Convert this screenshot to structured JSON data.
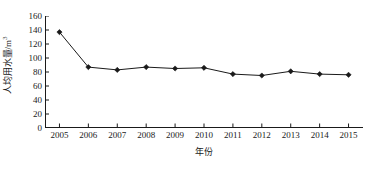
{
  "chart_data": {
    "type": "line",
    "title": "",
    "xlabel": "年份",
    "ylabel": "人均用水量/m³",
    "ylabel_main": "人均用水量/m",
    "ylabel_exponent": "3",
    "categories": [
      "2005",
      "2006",
      "2007",
      "2008",
      "2009",
      "2010",
      "2011",
      "2012",
      "2013",
      "2014",
      "2015"
    ],
    "values": [
      137,
      87,
      83,
      87,
      85,
      86,
      77,
      75,
      81,
      77,
      76
    ],
    "series": [
      {
        "name": "人均用水量",
        "values": [
          137,
          87,
          83,
          87,
          85,
          86,
          77,
          75,
          81,
          77,
          76
        ]
      }
    ],
    "ylim": [
      0,
      160
    ],
    "y_ticks": [
      0,
      20,
      40,
      60,
      80,
      100,
      120,
      140,
      160
    ],
    "y_tick_labels": [
      "0",
      "20",
      "40",
      "60",
      "80",
      "100",
      "120",
      "140",
      "160"
    ],
    "x_tick_labels": [
      "2005",
      "2006",
      "2007",
      "2008",
      "2009",
      "2010",
      "2011",
      "2012",
      "2013",
      "2014",
      "2015"
    ],
    "grid": false,
    "legend": false,
    "legend_position": "none",
    "line_color": "#1a1a1a",
    "marker_color": "#1a1a1a",
    "marker_shape": "diamond",
    "axis_color": "#1a1a1a",
    "background_color": "#ffffff"
  },
  "axes": {
    "y_title": "人均用水量/m",
    "y_title_sup": "3",
    "x_title": "年份"
  }
}
